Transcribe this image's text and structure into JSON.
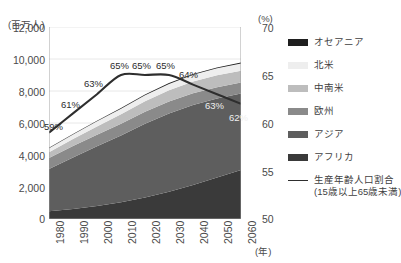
{
  "axes": {
    "left_unit": "(百万人)",
    "right_unit": "(%)",
    "year_unit": "(年)",
    "left_ticks": [
      "12,000",
      "10,000",
      "8,000",
      "6,000",
      "4,000",
      "2,000",
      "0"
    ],
    "right_ticks": [
      "70",
      "65",
      "60",
      "55",
      "50"
    ],
    "x_ticks": [
      "1980",
      "1990",
      "2000",
      "2010",
      "2020",
      "2030",
      "2040",
      "2050",
      "2060"
    ]
  },
  "partial_top_text": "",
  "legend": {
    "items": [
      {
        "label": "オセアニア",
        "color": "#1f1f1f",
        "type": "area"
      },
      {
        "label": "北米",
        "color": "#eeeeee",
        "type": "area"
      },
      {
        "label": "中南米",
        "color": "#bdbdbd",
        "type": "area"
      },
      {
        "label": "欧州",
        "color": "#8a8a8a",
        "type": "area"
      },
      {
        "label": "アジア",
        "color": "#5e5e5e",
        "type": "area"
      },
      {
        "label": "アフリカ",
        "color": "#3a3a3a",
        "type": "area"
      },
      {
        "label": "生産年齢人口割合",
        "sub": "(15歳以上65歳未満)",
        "color": "#2e2e2e",
        "type": "line"
      }
    ]
  },
  "chart_data": {
    "type": "area",
    "title": "",
    "xlabel": "(年)",
    "ylabel": "(百万人)",
    "y2label": "(%)",
    "grid": true,
    "legend_position": "right",
    "x": [
      1980,
      1990,
      2000,
      2010,
      2020,
      2030,
      2040,
      2050,
      2060
    ],
    "ylim": [
      0,
      12000
    ],
    "y2lim": [
      50,
      70
    ],
    "series": [
      {
        "name": "アフリカ",
        "color": "#3a3a3a",
        "values": [
          480,
          630,
          810,
          1040,
          1340,
          1700,
          2120,
          2590,
          3070
        ]
      },
      {
        "name": "アジア",
        "color": "#5e5e5e",
        "values": [
          2640,
          3210,
          3730,
          4180,
          4620,
          4900,
          5010,
          4940,
          4770
        ]
      },
      {
        "name": "欧州",
        "color": "#8a8a8a",
        "values": [
          693,
          721,
          727,
          736,
          744,
          739,
          725,
          707,
          690
        ]
      },
      {
        "name": "中南米",
        "color": "#bdbdbd",
        "values": [
          362,
          443,
          522,
          596,
          661,
          710,
          737,
          744,
          736
        ]
      },
      {
        "name": "北米",
        "color": "#eeeeee",
        "values": [
          254,
          280,
          313,
          343,
          371,
          396,
          417,
          435,
          451
        ]
      },
      {
        "name": "オセアニア",
        "color": "#1f1f1f",
        "values": [
          23,
          27,
          31,
          37,
          43,
          48,
          53,
          58,
          63
        ]
      }
    ],
    "totals": [
      4452,
      5311,
      6133,
      6932,
      7779,
      8493,
      9062,
      9474,
      9780
    ],
    "line_series": {
      "name": "生産年齢人口割合（15歳以上65歳未満）",
      "color": "#2e2e2e",
      "axis": "right",
      "values": [
        59,
        61,
        63,
        65,
        65,
        65,
        64,
        63,
        62
      ],
      "labels": [
        "59%",
        "61%",
        "63%",
        "65%",
        "65%",
        "65%",
        "64%",
        "63%",
        "62%"
      ]
    }
  }
}
